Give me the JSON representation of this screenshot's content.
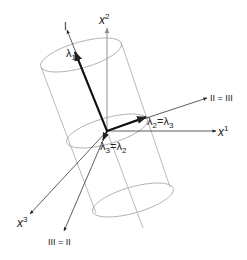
{
  "diagram": {
    "type": "3d-axes-with-cylinder",
    "colors": {
      "axis": "#333333",
      "thick_vector": "#111111",
      "cylinder": "#a8a8a8",
      "vertical_axis": "#9a9a9a",
      "background": "#ffffff"
    },
    "axes": {
      "x1": {
        "base": "x",
        "sup": "1"
      },
      "x2": {
        "base": "x",
        "sup": "2"
      },
      "x3": {
        "base": "x",
        "sup": "3"
      }
    },
    "principal_axes": {
      "I": "I",
      "II_eq_III": "II = III",
      "III_eq_II": "III = II"
    },
    "vectors": {
      "lambda1": {
        "base": "λ",
        "sub": "1"
      },
      "lambda2_eq_lambda3": {
        "base": "λ",
        "sub": "2",
        "eq": "=",
        "base2": "λ",
        "sub2": "3"
      },
      "lambda3_eq_lambda2": {
        "base": "λ",
        "sub": "3",
        "eq": "=",
        "base2": "λ",
        "sub2": "2"
      }
    }
  }
}
